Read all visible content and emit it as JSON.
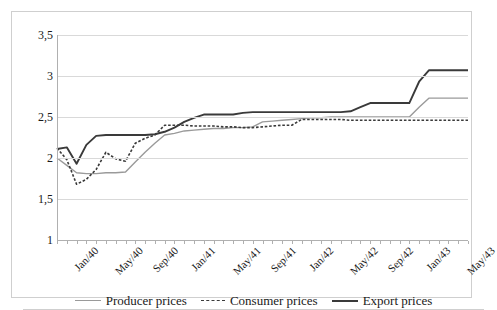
{
  "chart_data": {
    "type": "line",
    "title": "",
    "xlabel": "",
    "ylabel": "",
    "ylim": [
      1,
      3.5
    ],
    "yticks": [
      1,
      1.5,
      2,
      2.5,
      3,
      3.5
    ],
    "ytick_labels": [
      "1",
      "1,5",
      "2",
      "2,5",
      "3",
      "3,5"
    ],
    "grid": true,
    "legend_position": "bottom",
    "decimal_separator": ",",
    "x": [
      "Jan/40",
      "Feb/40",
      "Mar/40",
      "Apr/40",
      "May/40",
      "Jun/40",
      "Jul/40",
      "Aug/40",
      "Sep/40",
      "Oct/40",
      "Nov/40",
      "Dec/40",
      "Jan/41",
      "Feb/41",
      "Mar/41",
      "Apr/41",
      "May/41",
      "Jun/41",
      "Jul/41",
      "Aug/41",
      "Sep/41",
      "Oct/41",
      "Nov/41",
      "Dec/41",
      "Jan/42",
      "Feb/42",
      "Mar/42",
      "Apr/42",
      "May/42",
      "Jun/42",
      "Jul/42",
      "Aug/42",
      "Sep/42",
      "Oct/42",
      "Nov/42",
      "Dec/42",
      "Jan/43",
      "Feb/43",
      "Mar/43",
      "Apr/43",
      "May/43",
      "Jun/43",
      "Jul/43"
    ],
    "xtick_labels": [
      "Jan/40",
      "May/40",
      "Sep/40",
      "Jan/41",
      "May/41",
      "Sep/41",
      "Jan/42",
      "May/42",
      "Sep/42",
      "Jan/43",
      "May/43"
    ],
    "xtick_interval_months": 4,
    "series": [
      {
        "name": "Producer prices",
        "color": "#9a9a9a",
        "style": "solid",
        "values": [
          2.0,
          1.91,
          1.82,
          1.81,
          1.81,
          1.82,
          1.82,
          1.83,
          1.95,
          2.07,
          2.18,
          2.28,
          2.3,
          2.33,
          2.34,
          2.35,
          2.36,
          2.36,
          2.37,
          2.37,
          2.38,
          2.44,
          2.45,
          2.46,
          2.47,
          2.48,
          2.49,
          2.49,
          2.5,
          2.5,
          2.5,
          2.5,
          2.5,
          2.5,
          2.5,
          2.5,
          2.5,
          2.62,
          2.73,
          2.73,
          2.73,
          2.73,
          2.73
        ]
      },
      {
        "name": "Consumer prices",
        "color": "#3a3a3a",
        "style": "dashed",
        "values": [
          2.12,
          1.98,
          1.68,
          1.74,
          1.86,
          2.07,
          1.99,
          1.96,
          2.18,
          2.24,
          2.28,
          2.4,
          2.4,
          2.4,
          2.39,
          2.39,
          2.39,
          2.38,
          2.38,
          2.37,
          2.37,
          2.38,
          2.39,
          2.4,
          2.4,
          2.47,
          2.47,
          2.47,
          2.47,
          2.47,
          2.46,
          2.46,
          2.46,
          2.46,
          2.46,
          2.46,
          2.46,
          2.46,
          2.46,
          2.46,
          2.46,
          2.46,
          2.46
        ]
      },
      {
        "name": "Export prices",
        "color": "#3a3a3a",
        "style": "solid",
        "values": [
          2.11,
          2.13,
          1.93,
          2.16,
          2.27,
          2.28,
          2.28,
          2.28,
          2.28,
          2.28,
          2.29,
          2.32,
          2.37,
          2.44,
          2.49,
          2.53,
          2.53,
          2.53,
          2.53,
          2.55,
          2.56,
          2.56,
          2.56,
          2.56,
          2.56,
          2.56,
          2.56,
          2.56,
          2.56,
          2.56,
          2.57,
          2.62,
          2.67,
          2.67,
          2.67,
          2.67,
          2.67,
          2.93,
          3.07,
          3.07,
          3.07,
          3.07,
          3.07
        ]
      }
    ]
  },
  "legend": {
    "items": [
      {
        "label": "Producer prices"
      },
      {
        "label": "Consumer prices"
      },
      {
        "label": "Export prices"
      }
    ]
  },
  "caption_remnant": ""
}
